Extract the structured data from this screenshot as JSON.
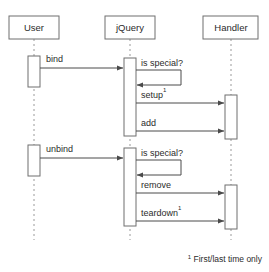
{
  "diagram": {
    "type": "uml-sequence-diagram",
    "canvas": {
      "width": 269,
      "height": 272
    },
    "colors": {
      "background": "#ffffff",
      "box_stroke": "#6f6f6f",
      "lifeline_dash": "#9a9a9a",
      "message_line": "#4a4a4a",
      "text": "#2b2b2b"
    },
    "participants": [
      {
        "id": "user",
        "label": "User",
        "x": 34,
        "box": {
          "x": 9,
          "y": 16,
          "w": 50,
          "h": 23
        }
      },
      {
        "id": "jquery",
        "label": "jQuery",
        "x": 130,
        "box": {
          "x": 105,
          "y": 16,
          "w": 50,
          "h": 23
        }
      },
      {
        "id": "handler",
        "label": "Handler",
        "x": 231,
        "box": {
          "x": 203,
          "y": 16,
          "w": 55,
          "h": 23
        }
      }
    ],
    "activations": [
      {
        "id": "user-act-1",
        "participant": "user",
        "x": 28,
        "y": 56,
        "w": 12,
        "h": 31
      },
      {
        "id": "user-act-2",
        "participant": "user",
        "x": 28,
        "y": 145,
        "w": 12,
        "h": 31
      },
      {
        "id": "jquery-act-1",
        "participant": "jquery",
        "x": 124,
        "y": 58,
        "w": 12,
        "h": 78
      },
      {
        "id": "jquery-act-2",
        "participant": "jquery",
        "x": 124,
        "y": 148,
        "w": 12,
        "h": 78
      },
      {
        "id": "handler-act-1",
        "participant": "handler",
        "x": 225,
        "y": 95,
        "w": 12,
        "h": 44
      },
      {
        "id": "handler-act-2",
        "participant": "handler",
        "x": 225,
        "y": 185,
        "w": 12,
        "h": 44
      }
    ],
    "messages": [
      {
        "id": "msg-bind",
        "label": "bind",
        "superscript": "",
        "from": "user",
        "to": "jquery",
        "kind": "call",
        "y": 68,
        "x1": 40,
        "x2": 124,
        "label_x": 46,
        "label_y": 62
      },
      {
        "id": "msg-is-special-1",
        "label": "is special?",
        "superscript": "",
        "from": "jquery",
        "to": "jquery",
        "kind": "self",
        "y": 70,
        "y_return": 85,
        "x1": 136,
        "x2": 181,
        "label_x": 141,
        "label_y": 66
      },
      {
        "id": "msg-setup",
        "label": "setup",
        "superscript": "1",
        "from": "jquery",
        "to": "handler",
        "kind": "call",
        "y": 103,
        "x1": 136,
        "x2": 225,
        "label_x": 141,
        "label_y": 98
      },
      {
        "id": "msg-add",
        "label": "add",
        "superscript": "",
        "from": "jquery",
        "to": "handler",
        "kind": "call",
        "y": 131,
        "x1": 136,
        "x2": 225,
        "label_x": 141,
        "label_y": 126
      },
      {
        "id": "msg-unbind",
        "label": "unbind",
        "superscript": "",
        "from": "user",
        "to": "jquery",
        "kind": "call",
        "y": 158,
        "x1": 40,
        "x2": 124,
        "label_x": 46,
        "label_y": 152
      },
      {
        "id": "msg-is-special-2",
        "label": "is special?",
        "superscript": "",
        "from": "jquery",
        "to": "jquery",
        "kind": "self",
        "y": 160,
        "y_return": 175,
        "x1": 136,
        "x2": 181,
        "label_x": 141,
        "label_y": 156
      },
      {
        "id": "msg-remove",
        "label": "remove",
        "superscript": "",
        "from": "jquery",
        "to": "handler",
        "kind": "call",
        "y": 193,
        "x1": 136,
        "x2": 225,
        "label_x": 141,
        "label_y": 188
      },
      {
        "id": "msg-teardown",
        "label": "teardown",
        "superscript": "1",
        "from": "jquery",
        "to": "handler",
        "kind": "call",
        "y": 221,
        "x1": 136,
        "x2": 225,
        "label_x": 141,
        "label_y": 216
      }
    ],
    "footnote": {
      "marker": "1",
      "text": "First/last time only",
      "x": 262,
      "y": 262
    }
  }
}
